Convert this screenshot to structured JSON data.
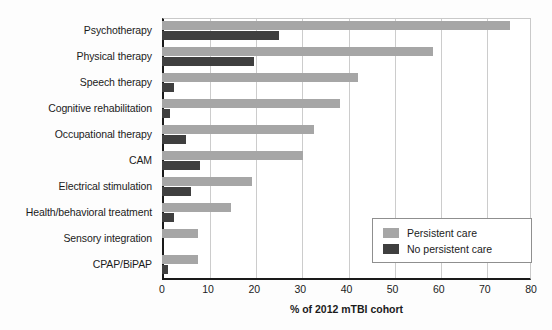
{
  "chart_data": {
    "type": "bar",
    "orientation": "horizontal",
    "title": "",
    "xlabel": "% of 2012 mTBI cohort",
    "ylabel": "",
    "xlim": [
      0,
      80
    ],
    "xticks": [
      0,
      10,
      20,
      30,
      40,
      50,
      60,
      70,
      80
    ],
    "grid": "vertical",
    "legend_position": "inner-right",
    "categories": [
      "Psychotherapy",
      "Physical therapy",
      "Speech therapy",
      "Cognitive rehabilitation",
      "Occupational therapy",
      "CAM",
      "Electrical stimulation",
      "Health/behavioral treatment",
      "Sensory integration",
      "CPAP/BiPAP"
    ],
    "series": [
      {
        "name": "Persistent care",
        "color": "#a6a6a6",
        "values": [
          75.5,
          58.8,
          42.5,
          38.5,
          33.0,
          30.5,
          19.5,
          15.0,
          7.7,
          7.7
        ]
      },
      {
        "name": "No persistent care",
        "color": "#3f3f3f",
        "values": [
          25.3,
          20.0,
          2.5,
          1.8,
          5.3,
          8.2,
          6.3,
          2.5,
          0.0,
          1.4
        ]
      }
    ]
  },
  "axis": {
    "x_title": "% of 2012 mTBI cohort",
    "tick_labels": [
      "0",
      "10",
      "20",
      "30",
      "40",
      "50",
      "60",
      "70",
      "80"
    ]
  },
  "legend": {
    "entries": [
      {
        "label": "Persistent care",
        "color": "#a6a6a6"
      },
      {
        "label": "No persistent care",
        "color": "#3f3f3f"
      }
    ]
  }
}
